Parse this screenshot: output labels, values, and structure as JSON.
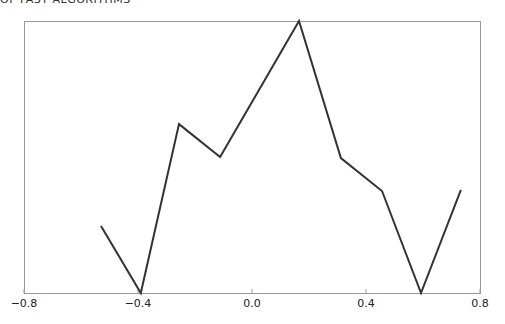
{
  "chart_data": {
    "type": "line",
    "title": "OF FAST ALGORITHMS",
    "xlabel": "",
    "ylabel": "",
    "xlim": [
      -0.8,
      0.8
    ],
    "ylim": [
      0,
      1
    ],
    "xticks": [
      -0.8,
      -0.4,
      0.0,
      0.4,
      0.8
    ],
    "xtick_labels": [
      "−0.8",
      "−0.4",
      "0.0",
      "0.4",
      "0.8"
    ],
    "yticks": [],
    "grid": false,
    "legend": "none",
    "series": [
      {
        "name": "series-1",
        "color": "#333333",
        "x": [
          -0.53,
          -0.39,
          -0.256,
          -0.112,
          0.165,
          0.312,
          0.456,
          0.593,
          0.733
        ],
        "y": [
          0.246,
          0.0,
          0.621,
          0.5,
          1.0,
          0.496,
          0.375,
          0.0,
          0.379
        ]
      }
    ]
  },
  "colors": {
    "axis": "#999999",
    "line": "#333333",
    "text": "#222222"
  }
}
